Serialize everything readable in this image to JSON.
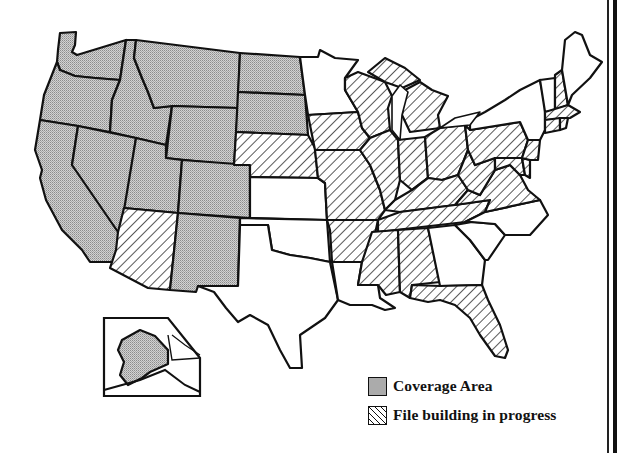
{
  "map": {
    "title": "",
    "region": "United States",
    "categories": {
      "coverage": {
        "label": "Coverage Area",
        "pattern": "stippled-gray",
        "color": "#c8c8c8",
        "states": [
          "WA",
          "OR",
          "CA",
          "ID",
          "NV",
          "MT",
          "WY",
          "UT",
          "CO",
          "NM",
          "ND",
          "SD",
          "AK"
        ]
      },
      "progress": {
        "label": "File building in progress",
        "pattern": "diagonal-hatch",
        "color": "#111111",
        "states": [
          "AZ",
          "NE",
          "IA",
          "MO",
          "AR",
          "MS",
          "AL",
          "FL",
          "IL",
          "WI",
          "MI",
          "IN",
          "OH",
          "KY",
          "TN",
          "WV",
          "VA",
          "PA",
          "MD",
          "DE",
          "NJ",
          "CT",
          "RI",
          "MA",
          "NH"
        ]
      },
      "none": {
        "label": "",
        "pattern": "blank",
        "color": "#ffffff",
        "states": [
          "MN",
          "KS",
          "OK",
          "TX",
          "LA",
          "GA",
          "SC",
          "NC",
          "NY",
          "VT",
          "ME"
        ]
      }
    },
    "inset": "Alaska"
  },
  "legend": {
    "items": [
      {
        "label": "Coverage Area",
        "swatch": "stippled-gray"
      },
      {
        "label": "File building in progress",
        "swatch": "diagonal-hatch"
      }
    ]
  }
}
